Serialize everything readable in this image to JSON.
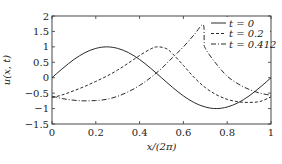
{
  "chart_data": {
    "type": "line",
    "title": "",
    "xlabel": "x/(2π)",
    "ylabel": "u(x, t)",
    "xlim": [
      0,
      1
    ],
    "ylim": [
      -1.5,
      2
    ],
    "xticks": [
      0,
      0.2,
      0.4,
      0.6,
      0.8,
      1
    ],
    "xtick_labels": [
      "0",
      "0.2",
      "0.4",
      "0.6",
      "0.8",
      "1"
    ],
    "yticks": [
      -1.5,
      -1,
      -0.5,
      0,
      0.5,
      1,
      1.5,
      2
    ],
    "ytick_labels": [
      "−1.5",
      "−1",
      "−0.5",
      "0",
      "0.5",
      "1",
      "1.5",
      "2"
    ],
    "grid": false,
    "legend_position": "upper right",
    "series": [
      {
        "name": "t = 0",
        "style": "solid",
        "x": [
          0,
          0.05,
          0.1,
          0.15,
          0.2,
          0.25,
          0.3,
          0.35,
          0.4,
          0.45,
          0.5,
          0.55,
          0.6,
          0.65,
          0.7,
          0.75,
          0.8,
          0.85,
          0.9,
          0.95,
          1
        ],
        "y": [
          0,
          0.31,
          0.59,
          0.81,
          0.95,
          1.0,
          0.95,
          0.81,
          0.59,
          0.31,
          0,
          -0.31,
          -0.59,
          -0.81,
          -0.95,
          -1.0,
          -0.95,
          -0.81,
          -0.59,
          -0.31,
          0
        ]
      },
      {
        "name": "t = 0.2",
        "style": "dashed",
        "x": [
          0,
          0.05,
          0.1,
          0.15,
          0.2,
          0.25,
          0.3,
          0.35,
          0.4,
          0.45,
          0.48,
          0.52,
          0.55,
          0.6,
          0.65,
          0.7,
          0.75,
          0.8,
          0.85,
          0.9,
          0.95,
          1
        ],
        "y": [
          -0.65,
          -0.55,
          -0.42,
          -0.28,
          -0.12,
          0.05,
          0.25,
          0.48,
          0.72,
          0.93,
          1.0,
          0.95,
          0.78,
          0.4,
          0.0,
          -0.32,
          -0.55,
          -0.7,
          -0.78,
          -0.8,
          -0.77,
          -0.62
        ]
      },
      {
        "name": "t = 0.412",
        "style": "dashdot",
        "x": [
          0,
          0.05,
          0.1,
          0.15,
          0.2,
          0.25,
          0.3,
          0.35,
          0.4,
          0.45,
          0.5,
          0.55,
          0.6,
          0.65,
          0.69,
          0.695,
          0.7,
          0.75,
          0.8,
          0.85,
          0.9,
          0.95,
          1
        ],
        "y": [
          -0.6,
          -0.68,
          -0.73,
          -0.75,
          -0.74,
          -0.7,
          -0.6,
          -0.45,
          -0.25,
          0.0,
          0.3,
          0.65,
          1.0,
          1.4,
          1.72,
          1.2,
          0.95,
          0.45,
          0.05,
          -0.2,
          -0.38,
          -0.5,
          -0.57
        ]
      }
    ]
  },
  "legend": {
    "items": [
      {
        "label": "t = 0",
        "style": "solid"
      },
      {
        "label": "t = 0.2",
        "style": "dashed"
      },
      {
        "label": "t = 0.412",
        "style": "dashdot"
      }
    ]
  },
  "colors": {
    "line": "#2a2a2a",
    "axis": "#333333",
    "background": "#ffffff"
  }
}
